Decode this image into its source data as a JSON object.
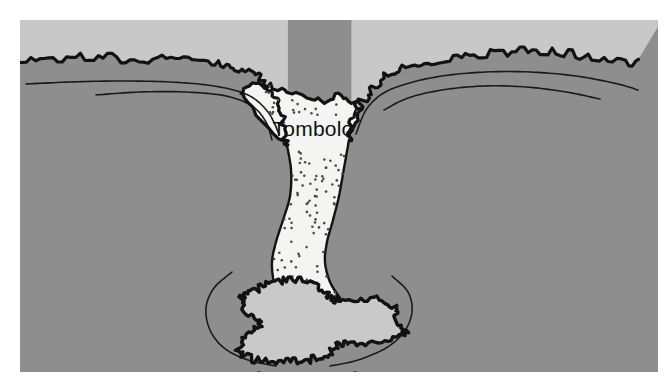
{
  "figure": {
    "kind": "coastal-landform-diagram",
    "subject": "Tombolo",
    "canvas": {
      "width": 670,
      "height": 392,
      "background": "#ffffff"
    },
    "panel": {
      "x": 20,
      "y": 20,
      "width": 638,
      "height": 352
    }
  },
  "labels": {
    "tombolo": {
      "text": "Tombolo",
      "x": 313,
      "y": 136,
      "font_size": 21,
      "color": "#111111",
      "anchor": "middle"
    }
  },
  "colors": {
    "sea": "#8e8e8e",
    "land": "#c8c8c8",
    "island": "#c9c9c9",
    "sand": "#f4f4f2",
    "outline": "#121212",
    "contour": "#1a1a1a",
    "stipple": "#4a4a4a",
    "page": "#ffffff"
  },
  "regions": [
    {
      "name": "sea",
      "role": "water-body",
      "fill": "#8e8e8e"
    },
    {
      "name": "mainland-left",
      "role": "headland",
      "fill": "#c8c8c8"
    },
    {
      "name": "mainland-right",
      "role": "headland",
      "fill": "#c8c8c8"
    },
    {
      "name": "tombolo-sandbar",
      "role": "depositional-landform",
      "fill": "#f4f4f2"
    },
    {
      "name": "offshore-island",
      "role": "island",
      "fill": "#c9c9c9"
    }
  ],
  "geometry": {
    "coast_left": {
      "comment": "Mainland coastline, left headland; smooth baseline before jagged surf is applied.",
      "points": [
        [
          0,
          62
        ],
        [
          40,
          59
        ],
        [
          85,
          58
        ],
        [
          130,
          58
        ],
        [
          175,
          60
        ],
        [
          215,
          63
        ],
        [
          240,
          68
        ],
        [
          258,
          78
        ],
        [
          272,
          96
        ],
        [
          281,
          118
        ],
        [
          287,
          145
        ]
      ]
    },
    "coast_right": {
      "comment": "Mainland coastline, right headland.",
      "points": [
        [
          349,
          140
        ],
        [
          357,
          112
        ],
        [
          368,
          92
        ],
        [
          384,
          78
        ],
        [
          406,
          68
        ],
        [
          438,
          60
        ],
        [
          478,
          54
        ],
        [
          520,
          52
        ],
        [
          560,
          53
        ],
        [
          600,
          57
        ],
        [
          638,
          62
        ]
      ]
    },
    "tombolo_left_edge": {
      "comment": "Left bank of the sand bar from shore down to the island.",
      "points": [
        [
          287,
          145
        ],
        [
          291,
          170
        ],
        [
          290,
          196
        ],
        [
          283,
          220
        ],
        [
          276,
          242
        ],
        [
          272,
          262
        ],
        [
          274,
          282
        ],
        [
          281,
          298
        ]
      ]
    },
    "tombolo_right_edge": {
      "comment": "Right bank of the sand bar from shore down to the island.",
      "points": [
        [
          349,
          140
        ],
        [
          344,
          168
        ],
        [
          339,
          196
        ],
        [
          333,
          220
        ],
        [
          327,
          242
        ],
        [
          325,
          262
        ],
        [
          330,
          282
        ],
        [
          340,
          298
        ]
      ]
    },
    "tombolo_top_shore": {
      "comment": "Jagged waterline across the head of the bar joining the two headlands.",
      "points": [
        [
          287,
          145
        ],
        [
          240,
          96
        ],
        [
          262,
          86
        ],
        [
          290,
          92
        ],
        [
          318,
          100
        ],
        [
          346,
          96
        ],
        [
          360,
          112
        ],
        [
          349,
          140
        ]
      ]
    },
    "island_outline": {
      "comment": "Closed rough outline of the offshore island (plan view).",
      "center": [
        310,
        322
      ],
      "radius_x": 86,
      "radius_y": 44
    },
    "contours": [
      {
        "name": "contour-left-outer",
        "points": [
          [
            26,
            84
          ],
          [
            70,
            82
          ],
          [
            120,
            81
          ],
          [
            170,
            82
          ],
          [
            214,
            86
          ],
          [
            248,
            95
          ],
          [
            268,
            112
          ],
          [
            279,
            134
          ]
        ]
      },
      {
        "name": "contour-left-inner",
        "points": [
          [
            96,
            95
          ],
          [
            140,
            92
          ],
          [
            186,
            92
          ],
          [
            226,
            96
          ],
          [
            252,
            106
          ],
          [
            266,
            122
          ],
          [
            272,
            140
          ]
        ]
      },
      {
        "name": "contour-right-outer",
        "points": [
          [
            356,
            134
          ],
          [
            366,
            110
          ],
          [
            382,
            94
          ],
          [
            406,
            84
          ],
          [
            442,
            76
          ],
          [
            486,
            72
          ],
          [
            530,
            72
          ],
          [
            576,
            76
          ],
          [
            618,
            84
          ],
          [
            638,
            90
          ]
        ]
      },
      {
        "name": "contour-right-inner",
        "points": [
          [
            384,
            110
          ],
          [
            408,
            98
          ],
          [
            442,
            90
          ],
          [
            484,
            86
          ],
          [
            526,
            87
          ],
          [
            566,
            92
          ],
          [
            600,
            99
          ]
        ]
      },
      {
        "name": "contour-island-left",
        "points": [
          [
            232,
            272
          ],
          [
            214,
            288
          ],
          [
            206,
            308
          ],
          [
            210,
            330
          ],
          [
            224,
            348
          ],
          [
            248,
            360
          ],
          [
            276,
            366
          ]
        ]
      },
      {
        "name": "contour-island-right",
        "points": [
          [
            392,
            276
          ],
          [
            408,
            292
          ],
          [
            412,
            312
          ],
          [
            404,
            332
          ],
          [
            386,
            348
          ],
          [
            358,
            360
          ],
          [
            330,
            366
          ]
        ]
      },
      {
        "name": "contour-island-bottom",
        "points": [
          [
            258,
            372
          ],
          [
            290,
            378
          ],
          [
            324,
            378
          ],
          [
            356,
            372
          ]
        ]
      }
    ],
    "stipple": {
      "comment": "Sand grain dots scattered over the tombolo bar.",
      "count": 118,
      "radius": 1.3,
      "color": "#4a4a4a"
    }
  }
}
